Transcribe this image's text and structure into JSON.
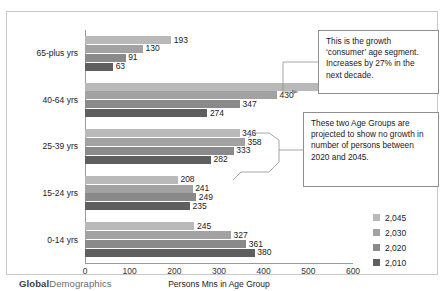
{
  "logo": {
    "bold": "Global",
    "light": "Demographics"
  },
  "legend": {
    "position": "right-bottom",
    "entries": [
      {
        "label": "2,045",
        "color": "#b9b9b9"
      },
      {
        "label": "2,030",
        "color": "#a2a2a2"
      },
      {
        "label": "2,020",
        "color": "#8a8a8a"
      },
      {
        "label": "2,010",
        "color": "#5f5f5f"
      }
    ]
  },
  "callouts": [
    {
      "id": "callout-1",
      "text": "This is the growth ‘consumer’ age segment.  Increases by 27% in the next decade."
    },
    {
      "id": "callout-2",
      "text": "These two Age Groups are projected to show no growth in number of persons between 2020 and 2045."
    }
  ],
  "chart_data": {
    "type": "bar",
    "orientation": "horizontal",
    "title": "",
    "xlabel": "Persons Mns in Age Group",
    "ylabel": "",
    "xlim": [
      0,
      600
    ],
    "xticks": [
      0,
      100,
      200,
      300,
      400,
      500,
      600
    ],
    "grid": false,
    "categories": [
      "0-14 yrs",
      "15-24 yrs",
      "25-39 yrs",
      "40-64 yrs",
      "65-plus yrs"
    ],
    "series": [
      {
        "name": "2,045",
        "color": "#b9b9b9",
        "values": [
          245,
          208,
          346,
          528,
          193
        ]
      },
      {
        "name": "2,030",
        "color": "#a2a2a2",
        "values": [
          327,
          241,
          358,
          430,
          130
        ]
      },
      {
        "name": "2,020",
        "color": "#8a8a8a",
        "values": [
          361,
          249,
          333,
          347,
          91
        ]
      },
      {
        "name": "2,010",
        "color": "#5f5f5f",
        "values": [
          380,
          235,
          282,
          274,
          63
        ]
      }
    ]
  }
}
